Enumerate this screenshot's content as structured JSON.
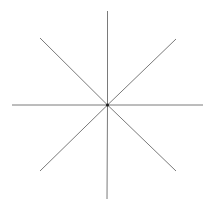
{
  "diagram": {
    "type": "star-burst",
    "background_color": "#ffffff",
    "line_color": "#7a7a7a",
    "center_color": "#222222",
    "line_width": 1,
    "center": {
      "x": 107.5,
      "y": 105
    },
    "rays": [
      {
        "name": "north",
        "x2": 107.5,
        "y2": 11
      },
      {
        "name": "north-east",
        "x2": 176,
        "y2": 39
      },
      {
        "name": "east",
        "x2": 203,
        "y2": 105
      },
      {
        "name": "south-east",
        "x2": 176,
        "y2": 171
      },
      {
        "name": "south",
        "x2": 107,
        "y2": 199
      },
      {
        "name": "south-west",
        "x2": 40,
        "y2": 171
      },
      {
        "name": "west",
        "x2": 12,
        "y2": 105
      },
      {
        "name": "north-west",
        "x2": 40,
        "y2": 38
      }
    ]
  }
}
